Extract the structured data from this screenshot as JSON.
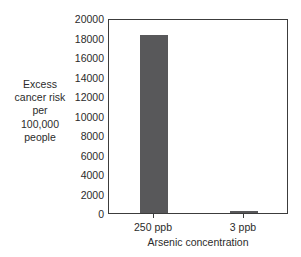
{
  "chart_data": {
    "type": "bar",
    "title": "",
    "categories": [
      "250 ppb",
      "3 ppb"
    ],
    "values": [
      18300,
      200
    ],
    "xlabel": "Arsenic concentration",
    "ylabel": "Excess cancer risk per 100,000 people",
    "ylabel_lines": [
      "Excess",
      "cancer risk",
      "per",
      "100,000",
      "people"
    ],
    "ylim": [
      0,
      20000
    ],
    "ytick_values": [
      20000,
      18000,
      16000,
      14000,
      12000,
      10000,
      8000,
      6000,
      4000,
      2000,
      0
    ],
    "ytick_labels": [
      "20000",
      "18000",
      "16000",
      "14000",
      "12000",
      "10000",
      "8000",
      "6000",
      "4000",
      "2000",
      "0"
    ],
    "grid": false,
    "legend": false,
    "bar_color": "#58585a",
    "frame_color": "#3c3c3c",
    "background_color": "#ffffff"
  }
}
